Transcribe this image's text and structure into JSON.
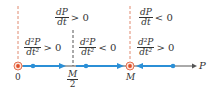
{
  "diagram": {
    "type": "phase-line",
    "axis_label": "P",
    "points": {
      "zero": "0",
      "half": {
        "numerator": "M",
        "denominator": "2"
      },
      "carrying_capacity": "M"
    },
    "first_derivative_labels": [
      {
        "num": "dP",
        "den": "dt",
        "relation": "> 0"
      },
      {
        "num": "dP",
        "den": "dt",
        "relation": "< 0"
      }
    ],
    "second_derivative_labels": [
      {
        "num": "d²P",
        "den": "dt²",
        "relation": "> 0"
      },
      {
        "num": "d²P",
        "den": "dt²",
        "relation": "< 0"
      },
      {
        "num": "d²P",
        "den": "dt²",
        "relation": "> 0"
      }
    ],
    "colors": {
      "axis": "#555555",
      "flow": "#2b8fd6",
      "equilibrium": "#e0502a",
      "dashed_red": "#e08a70",
      "dashed_dark": "#555555"
    }
  }
}
